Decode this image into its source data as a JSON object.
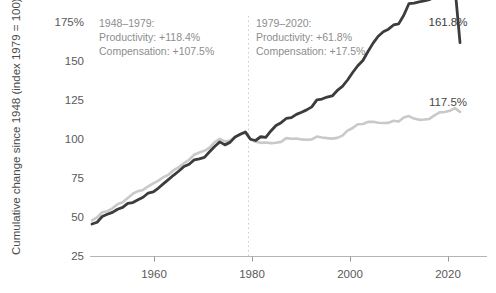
{
  "chart_data": {
    "type": "line",
    "title": "",
    "xlabel": "",
    "ylabel": "Cumulative change since 1948 (index 1979 = 100)",
    "xlim": [
      1948,
      2020
    ],
    "ylim": [
      25,
      175
    ],
    "grid": false,
    "legend_position": "none",
    "yticks": [
      "175%",
      "150",
      "125",
      "100",
      "75",
      "50",
      "25"
    ],
    "ytick_values": [
      175,
      150,
      125,
      100,
      75,
      50,
      25
    ],
    "xticks": [
      "1960",
      "1980",
      "2000",
      "2020"
    ],
    "xtick_values": [
      1960,
      1980,
      2000,
      2020
    ],
    "colors": {
      "productivity": "#3c3c3c",
      "compensation": "#c9c9c9",
      "divider": "#cfcfcf",
      "axis": "#b5b5b5",
      "annotation_text": "#8d8d8d"
    },
    "reference_line": {
      "x": 1979,
      "style": "dotted",
      "label": ""
    },
    "annotations": [
      {
        "name": "period-1948-1979",
        "x": 1953,
        "lines": [
          "1948–1979:",
          "Productivity: +118.4%",
          "Compensation: +107.5%"
        ]
      },
      {
        "name": "period-1979-2020",
        "x": 1980,
        "lines": [
          "1979–2020:",
          "Productivity: +61.8%",
          "Compensation: +17.5%"
        ]
      }
    ],
    "end_labels": [
      {
        "series": "Productivity",
        "value": "161.8%"
      },
      {
        "series": "Compensation",
        "value": "117.5%"
      }
    ],
    "x": [
      1948,
      1949,
      1950,
      1951,
      1952,
      1953,
      1954,
      1955,
      1956,
      1957,
      1958,
      1959,
      1960,
      1961,
      1962,
      1963,
      1964,
      1965,
      1966,
      1967,
      1968,
      1969,
      1970,
      1971,
      1972,
      1973,
      1974,
      1975,
      1976,
      1977,
      1978,
      1979,
      1980,
      1981,
      1982,
      1983,
      1984,
      1985,
      1986,
      1987,
      1988,
      1989,
      1990,
      1991,
      1992,
      1993,
      1994,
      1995,
      1996,
      1997,
      1998,
      1999,
      2000,
      2001,
      2002,
      2003,
      2004,
      2005,
      2006,
      2007,
      2008,
      2009,
      2010,
      2011,
      2012,
      2013,
      2014,
      2015,
      2016,
      2017,
      2018,
      2019,
      2020
    ],
    "series": [
      {
        "name": "Productivity",
        "color": "#3c3c3c",
        "values": [
          45.8,
          46.9,
          50.6,
          52.0,
          53.2,
          55.2,
          56.4,
          59.0,
          59.5,
          61.3,
          62.9,
          65.6,
          66.4,
          68.8,
          71.6,
          74.3,
          77.1,
          79.7,
          82.6,
          84.0,
          86.8,
          87.5,
          88.4,
          92.0,
          95.4,
          98.3,
          96.4,
          98.0,
          101.4,
          103.2,
          104.7,
          104.0,
          103.2,
          105.7,
          105.2,
          109.5,
          113.1,
          115.0,
          117.8,
          118.4,
          120.5,
          122.0,
          123.6,
          125.5,
          130.2,
          130.7,
          132.1,
          132.8,
          136.5,
          139.2,
          143.4,
          148.4,
          152.9,
          156.4,
          162.3,
          168.0,
          172.5,
          175.5,
          177.2,
          180.0,
          180.7,
          186.5,
          194.2,
          194.6,
          195.3,
          196.0,
          196.9,
          198.6,
          199.0,
          200.4,
          203.0,
          205.5,
          209.0
        ],
        "values_index_1979_100": [
          45.8,
          46.9,
          50.6,
          52.0,
          53.2,
          55.2,
          56.4,
          59.0,
          59.5,
          61.3,
          62.9,
          65.6,
          66.4,
          68.8,
          71.6,
          74.3,
          77.1,
          79.7,
          82.6,
          84.0,
          86.8,
          87.5,
          88.4,
          92.0,
          95.4,
          98.3,
          96.4,
          98.0,
          101.4,
          103.2,
          104.7,
          100.0,
          99.2,
          101.6,
          101.2,
          105.3,
          108.8,
          110.6,
          113.3,
          113.8,
          115.9,
          117.3,
          118.8,
          120.7,
          125.2,
          125.7,
          127.0,
          127.7,
          131.2,
          133.8,
          137.9,
          142.7,
          147.0,
          150.4,
          156.1,
          161.5,
          165.9,
          168.8,
          170.4,
          173.1,
          173.8,
          179.3,
          186.7,
          187.1,
          187.8,
          188.5,
          189.3,
          191.0,
          191.4,
          192.7,
          195.2,
          197.6,
          161.8
        ]
      },
      {
        "name": "Compensation",
        "color": "#c9c9c9",
        "values": [
          48.1,
          50.0,
          53.3,
          54.0,
          55.8,
          58.5,
          59.7,
          62.4,
          65.2,
          66.8,
          67.6,
          69.9,
          71.8,
          73.5,
          75.8,
          77.4,
          80.3,
          82.2,
          84.7,
          86.9,
          90.1,
          91.5,
          92.6,
          94.6,
          98.2,
          100.3,
          98.6,
          99.2,
          101.5,
          103.0,
          104.3,
          103.7,
          102.0,
          101.3,
          101.5,
          101.1,
          101.4,
          101.9,
          104.4,
          104.0,
          104.2,
          103.6,
          103.4,
          103.6,
          105.4,
          104.8,
          104.4,
          104.1,
          104.6,
          106.0,
          109.4,
          111.1,
          113.6,
          113.9,
          115.2,
          115.3,
          114.7,
          114.5,
          114.6,
          116.0,
          115.4,
          118.1,
          119.0,
          117.4,
          116.6,
          116.8,
          117.2,
          119.6,
          121.5,
          121.7,
          122.6,
          124.3,
          128.9
        ],
        "values_index_1979_100": [
          48.1,
          50.0,
          53.3,
          54.0,
          55.8,
          58.5,
          59.7,
          62.4,
          65.2,
          66.8,
          67.6,
          69.9,
          71.8,
          73.5,
          75.8,
          77.4,
          80.3,
          82.2,
          84.7,
          86.9,
          90.1,
          91.5,
          92.6,
          94.6,
          98.2,
          100.3,
          98.6,
          99.2,
          101.5,
          103.0,
          104.3,
          100.0,
          98.4,
          97.7,
          97.9,
          97.5,
          97.8,
          98.3,
          100.7,
          100.3,
          100.5,
          99.9,
          99.7,
          99.9,
          101.7,
          101.1,
          100.7,
          100.4,
          100.9,
          102.3,
          105.5,
          107.2,
          109.6,
          109.8,
          111.1,
          111.2,
          110.6,
          110.4,
          110.5,
          111.8,
          111.3,
          113.9,
          114.8,
          113.2,
          112.4,
          112.6,
          113.0,
          115.3,
          117.2,
          117.4,
          118.2,
          119.9,
          117.5
        ]
      }
    ]
  }
}
